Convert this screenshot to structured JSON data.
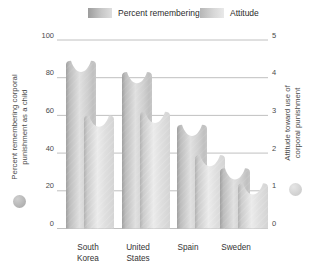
{
  "figure": {
    "legend": [
      {
        "label": "Percent remembering",
        "swatch": "gray-gradient-dark"
      },
      {
        "label": "Attitude",
        "swatch": "gray-gradient-light"
      }
    ],
    "left_axis": {
      "title_lines": [
        "Percent remembering corporal",
        "punishment as a child"
      ],
      "ticks": [
        100,
        80,
        60,
        40,
        20,
        0
      ],
      "dot_color": "#a5a5a5"
    },
    "right_axis": {
      "title_lines": [
        "Attitude toward use of",
        "corporal punishment"
      ],
      "ticks": [
        5,
        4,
        3,
        2,
        1,
        0
      ],
      "dot_color": "#c6c6c6"
    },
    "colors": {
      "bar_percent_dark": "#a0a0a0",
      "bar_percent_light": "#e0e0e0",
      "bar_attitude_dark": "#b2b2b2",
      "bar_attitude_light": "#ebebeb",
      "gridline": "#b9b9b9",
      "text": "#4a4a4a"
    }
  },
  "chart_data": {
    "type": "bar",
    "categories": [
      "South Korea",
      "United States",
      "Spain",
      "Sweden"
    ],
    "category_lines": [
      [
        "South",
        "Korea"
      ],
      [
        "United",
        "States"
      ],
      [
        "Spain"
      ],
      [
        "Sweden"
      ]
    ],
    "series": [
      {
        "name": "Percent remembering",
        "axis": "left",
        "values": [
          89,
          83,
          55,
          32
        ]
      },
      {
        "name": "Attitude",
        "axis": "right",
        "values": [
          3.0,
          3.1,
          1.95,
          1.2
        ]
      }
    ],
    "left_ylim": [
      0,
      100
    ],
    "right_ylim": [
      0,
      5
    ],
    "ylabel_left": "Percent remembering corporal punishment as a child",
    "ylabel_right": "Attitude toward use of corporal punishment",
    "grid": true,
    "legend_position": "top"
  }
}
